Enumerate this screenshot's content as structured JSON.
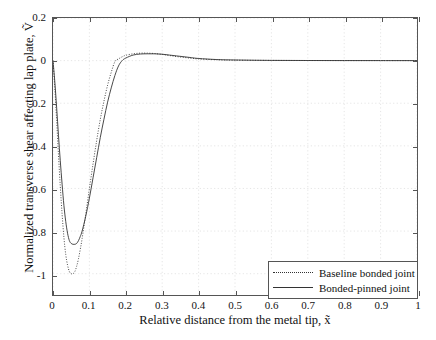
{
  "chart_data": {
    "type": "line",
    "title": "",
    "xlabel": "Relative distance from the metal tip, x̃",
    "ylabel": "Normalized transverse shear affecting lap plate, Ṽ",
    "xlim": [
      0,
      1
    ],
    "ylim": [
      -1.1,
      0.2
    ],
    "grid": true,
    "legend_position": "lower right",
    "xticks": [
      "0",
      "0.1",
      "0.2",
      "0.3",
      "0.4",
      "0.5",
      "0.6",
      "0.7",
      "0.8",
      "0.9",
      "1"
    ],
    "xtick_values": [
      0,
      0.1,
      0.2,
      0.3,
      0.4,
      0.5,
      0.6,
      0.7,
      0.8,
      0.9,
      1
    ],
    "yticks": [
      "0.2",
      "0",
      "-0.2",
      "-0.4",
      "-0.6",
      "-0.8",
      "-1"
    ],
    "ytick_values": [
      0.2,
      0,
      -0.2,
      -0.4,
      -0.6,
      -0.8,
      -1
    ],
    "x": [
      0,
      0.005,
      0.01,
      0.015,
      0.02,
      0.025,
      0.03,
      0.035,
      0.04,
      0.045,
      0.05,
      0.055,
      0.06,
      0.065,
      0.07,
      0.075,
      0.08,
      0.09,
      0.1,
      0.11,
      0.12,
      0.13,
      0.14,
      0.15,
      0.16,
      0.17,
      0.18,
      0.19,
      0.2,
      0.22,
      0.24,
      0.26,
      0.28,
      0.3,
      0.32,
      0.34,
      0.36,
      0.38,
      0.4,
      0.45,
      0.5,
      0.6,
      0.7,
      0.8,
      0.9,
      1
    ],
    "series": [
      {
        "name": "Baseline bonded joint",
        "style": "dotted",
        "color": "#333333",
        "minimum": -1.0,
        "minimum_at_x": 0.055,
        "peak": 0.035,
        "peak_at_x": 0.27,
        "values": [
          0,
          -0.13,
          -0.28,
          -0.44,
          -0.59,
          -0.72,
          -0.83,
          -0.91,
          -0.96,
          -0.99,
          -1.0,
          -1.0,
          -0.99,
          -0.965,
          -0.93,
          -0.885,
          -0.835,
          -0.72,
          -0.6,
          -0.485,
          -0.375,
          -0.275,
          -0.19,
          -0.115,
          -0.055,
          -0.005,
          0.008,
          0.018,
          0.025,
          0.032,
          0.035,
          0.035,
          0.033,
          0.029,
          0.024,
          0.019,
          0.015,
          0.011,
          0.008,
          0.004,
          0.002,
          0.001,
          0.0005,
          0.0002,
          0.0001,
          0
        ]
      },
      {
        "name": "Bonded-pinned joint",
        "style": "solid",
        "color": "#333333",
        "minimum": -0.86,
        "minimum_at_x": 0.065,
        "peak": 0.032,
        "peak_at_x": 0.29,
        "values": [
          0,
          -0.1,
          -0.22,
          -0.35,
          -0.47,
          -0.58,
          -0.68,
          -0.755,
          -0.81,
          -0.845,
          -0.858,
          -0.862,
          -0.862,
          -0.858,
          -0.845,
          -0.825,
          -0.8,
          -0.73,
          -0.645,
          -0.55,
          -0.455,
          -0.36,
          -0.275,
          -0.195,
          -0.128,
          -0.07,
          -0.025,
          0.0,
          0.012,
          0.026,
          0.031,
          0.032,
          0.032,
          0.03,
          0.026,
          0.022,
          0.018,
          0.014,
          0.01,
          0.005,
          0.003,
          0.001,
          0.0005,
          0.0002,
          0.0001,
          0
        ]
      }
    ]
  },
  "legend": {
    "items": [
      {
        "label": "Baseline bonded joint"
      },
      {
        "label": "Bonded-pinned joint"
      }
    ]
  }
}
